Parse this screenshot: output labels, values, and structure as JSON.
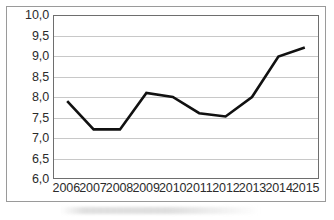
{
  "chart_data": {
    "type": "line",
    "title": "",
    "subtitle": "",
    "xlabel": "",
    "ylabel": "",
    "categories": [
      "2006",
      "2007",
      "2008",
      "2009",
      "2010",
      "2011",
      "2012",
      "2013",
      "2014",
      "2015"
    ],
    "values": [
      7.9,
      7.2,
      7.2,
      8.1,
      8.0,
      7.6,
      7.52,
      8.0,
      9.0,
      9.22
    ],
    "series": [
      {
        "name": "",
        "values": [
          7.9,
          7.2,
          7.2,
          8.1,
          8.0,
          7.6,
          7.52,
          8.0,
          9.0,
          9.22
        ]
      }
    ],
    "ylim": [
      6.0,
      10.0
    ],
    "ytick_values": [
      10.0,
      9.5,
      9.0,
      8.5,
      8.0,
      7.5,
      7.0,
      6.5,
      6.0
    ],
    "ytick_labels": [
      "10,0",
      "9,5",
      "9,0",
      "8,5",
      "8,0",
      "7,5",
      "7,0",
      "6,5",
      "6,0"
    ],
    "xtick_labels": [
      "2006",
      "2007",
      "2008",
      "2009",
      "2010",
      "2011",
      "2012",
      "2013",
      "2014",
      "2015"
    ],
    "grid": true,
    "grid_axis": "y",
    "legend": false,
    "legend_position": "none",
    "decimal_separator": ",",
    "markers": false,
    "line_color": "#111111",
    "line_width": 2.6,
    "grid_color": "#c8c8c8",
    "axis_color": "#6e6e6e",
    "frame_color": "#9a9a9a",
    "background_color": "#ffffff",
    "text_color": "#2b2b2b",
    "annotations": []
  }
}
